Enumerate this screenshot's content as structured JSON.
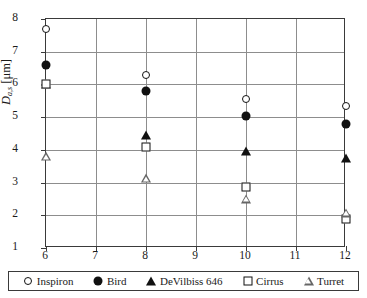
{
  "chart_data": {
    "type": "scatter",
    "title": "",
    "xlabel": "V̇g [l/min]",
    "ylabel": "Da,s [μm]",
    "xlim": [
      6,
      12
    ],
    "ylim": [
      1,
      8
    ],
    "xticks": [
      6,
      7,
      8,
      9,
      10,
      11,
      12
    ],
    "yticks": [
      1,
      2,
      3,
      4,
      5,
      6,
      7,
      8
    ],
    "grid": true,
    "legend_position": "bottom-inside",
    "x": [
      6,
      8,
      10,
      12
    ],
    "series": [
      {
        "name": "Inspiron",
        "marker": "circle-open",
        "x": [
          6,
          8,
          10,
          12
        ],
        "values": [
          7.7,
          6.3,
          5.55,
          5.35
        ]
      },
      {
        "name": "Bird",
        "marker": "circle-fill",
        "x": [
          6,
          8,
          10,
          12
        ],
        "values": [
          6.6,
          5.8,
          5.02,
          4.8
        ]
      },
      {
        "name": "DeVilbiss 646",
        "marker": "triangle-fill",
        "x": [
          6,
          8,
          10,
          12
        ],
        "values": [
          6.02,
          4.45,
          3.95,
          3.75
        ]
      },
      {
        "name": "Cirrus",
        "marker": "square-open",
        "x": [
          6,
          8,
          10,
          12
        ],
        "values": [
          6.0,
          4.1,
          2.85,
          1.9
        ]
      },
      {
        "name": "Turret",
        "marker": "triangle-open",
        "x": [
          6,
          8,
          10,
          12
        ],
        "values": [
          3.8,
          3.4,
          3.05,
          2.9
        ]
      }
    ]
  },
  "axis": {
    "y_title_main": "D",
    "y_title_sub": "a,s",
    "y_title_unit": "[μm]",
    "x_title_main": "V̇",
    "x_title_sub": "g",
    "x_title_unit": "[l/min]"
  },
  "colors": {
    "marker": "#111111",
    "grid": "#8d8d8d",
    "frame": "#3a3a3a"
  }
}
